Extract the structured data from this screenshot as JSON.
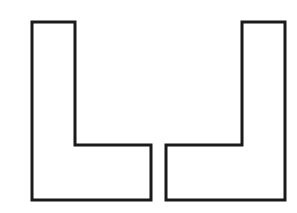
{
  "diagram": {
    "stroke_color": "#1a1a1a",
    "fill_color": "#ffffff",
    "shapes": [
      {
        "name": "left-l-shape",
        "points": "32,22 75,22 75,145 151,145 151,200 32,200"
      },
      {
        "name": "right-l-shape",
        "points": "285,22 242,22 242,145 166,145 166,200 285,200"
      }
    ]
  }
}
